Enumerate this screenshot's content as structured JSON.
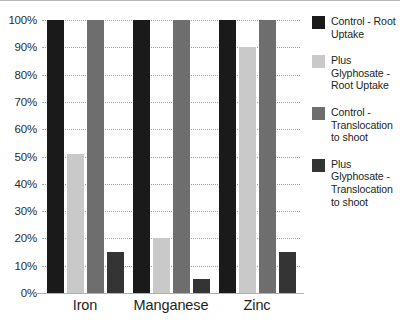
{
  "chart_data": {
    "type": "bar",
    "title": "",
    "xlabel": "",
    "ylabel": "",
    "categories": [
      "Iron",
      "Manganese",
      "Zinc"
    ],
    "series": [
      {
        "name": "Control - Root Uptake",
        "color": "#1a1a1a",
        "values": [
          100,
          100,
          100
        ]
      },
      {
        "name": "Plus Glyphosate - Root Uptake",
        "color": "#c9c9c9",
        "values": [
          51,
          20,
          90
        ]
      },
      {
        "name": "Control - Translocation to shoot",
        "color": "#6e6e6e",
        "values": [
          100,
          100,
          100
        ]
      },
      {
        "name": "Plus Glyphosate - Translocation to shoot",
        "color": "#343434",
        "values": [
          15,
          5,
          15
        ]
      }
    ],
    "ylim": [
      0,
      100
    ],
    "ytick_labels": [
      "100%",
      "90%",
      "80%",
      "70%",
      "60%",
      "50%",
      "40%",
      "30%",
      "20%",
      "10%",
      "0%"
    ],
    "ytick_values": [
      100,
      90,
      80,
      70,
      60,
      50,
      40,
      30,
      20,
      10,
      0
    ],
    "grid": true,
    "grid_style": "dotted",
    "legend_position": "right"
  },
  "legend": {
    "items": [
      {
        "label": "Control - Root Uptake",
        "color": "#1a1a1a"
      },
      {
        "label": "Plus Glyphosate - Root Uptake",
        "color": "#c9c9c9"
      },
      {
        "label": "Control - Translocation to shoot",
        "color": "#6e6e6e"
      },
      {
        "label": "Plus Glyphosate - Translocation to shoot",
        "color": "#343434"
      }
    ]
  }
}
